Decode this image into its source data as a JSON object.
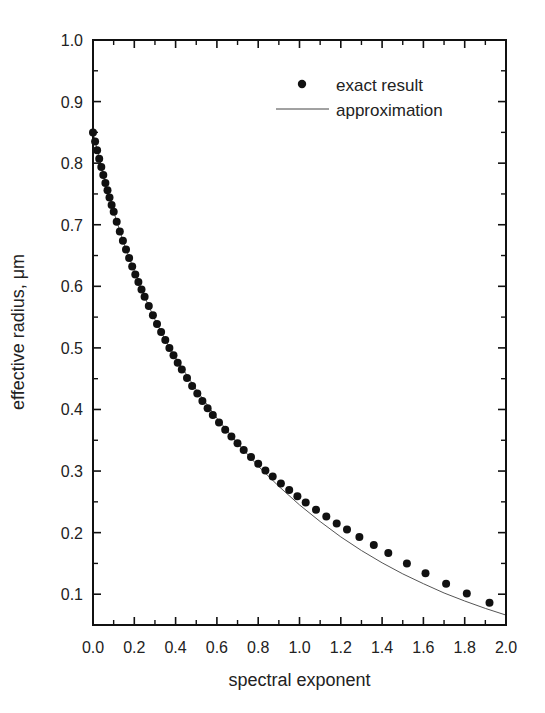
{
  "chart_data": {
    "type": "scatter",
    "title": "",
    "xlabel": "spectral exponent",
    "ylabel": "effective radius, μm",
    "xlim": [
      0.0,
      2.0
    ],
    "ylim": [
      0.05,
      1.0
    ],
    "grid": false,
    "legend_position": "upper right",
    "x_ticks": [
      "0.0",
      "0.2",
      "0.4",
      "0.6",
      "0.8",
      "1.0",
      "1.2",
      "1.4",
      "1.6",
      "1.8",
      "2.0"
    ],
    "y_ticks": [
      "0.1",
      "0.2",
      "0.3",
      "0.4",
      "0.5",
      "0.6",
      "0.7",
      "0.8",
      "0.9",
      "1.0"
    ],
    "legend": [
      {
        "label": "exact result",
        "marker": "dot"
      },
      {
        "label": "approximation",
        "marker": "line"
      }
    ],
    "series": [
      {
        "name": "exact result",
        "style": "markers",
        "x": [
          0.0,
          0.01,
          0.02,
          0.03,
          0.04,
          0.05,
          0.06,
          0.07,
          0.08,
          0.09,
          0.1,
          0.115,
          0.13,
          0.145,
          0.16,
          0.175,
          0.19,
          0.205,
          0.22,
          0.235,
          0.25,
          0.27,
          0.29,
          0.31,
          0.33,
          0.35,
          0.37,
          0.39,
          0.41,
          0.43,
          0.455,
          0.48,
          0.505,
          0.53,
          0.555,
          0.58,
          0.61,
          0.64,
          0.67,
          0.7,
          0.73,
          0.765,
          0.8,
          0.835,
          0.87,
          0.91,
          0.95,
          0.99,
          1.03,
          1.08,
          1.13,
          1.18,
          1.23,
          1.29,
          1.36,
          1.43,
          1.52,
          1.61,
          1.71,
          1.81,
          1.92
        ],
        "y": [
          0.85,
          0.835,
          0.821,
          0.807,
          0.794,
          0.781,
          0.768,
          0.756,
          0.744,
          0.732,
          0.721,
          0.705,
          0.689,
          0.674,
          0.66,
          0.646,
          0.632,
          0.619,
          0.607,
          0.595,
          0.583,
          0.568,
          0.553,
          0.539,
          0.526,
          0.513,
          0.5,
          0.488,
          0.476,
          0.465,
          0.451,
          0.438,
          0.426,
          0.414,
          0.402,
          0.391,
          0.379,
          0.367,
          0.356,
          0.345,
          0.334,
          0.323,
          0.312,
          0.301,
          0.291,
          0.28,
          0.269,
          0.259,
          0.249,
          0.237,
          0.226,
          0.215,
          0.205,
          0.193,
          0.18,
          0.167,
          0.15,
          0.134,
          0.117,
          0.101,
          0.086
        ]
      },
      {
        "name": "approximation",
        "style": "line",
        "x": [
          0.0,
          0.05,
          0.1,
          0.15,
          0.2,
          0.25,
          0.3,
          0.35,
          0.4,
          0.5,
          0.6,
          0.7,
          0.8,
          0.9,
          1.0,
          1.1,
          1.2,
          1.3,
          1.4,
          1.5,
          1.6,
          1.7,
          1.8,
          1.9,
          2.0
        ],
        "y": [
          0.85,
          0.781,
          0.721,
          0.669,
          0.625,
          0.583,
          0.546,
          0.513,
          0.484,
          0.432,
          0.386,
          0.345,
          0.308,
          0.275,
          0.245,
          0.218,
          0.193,
          0.171,
          0.151,
          0.133,
          0.117,
          0.102,
          0.089,
          0.077,
          0.066
        ]
      }
    ]
  }
}
